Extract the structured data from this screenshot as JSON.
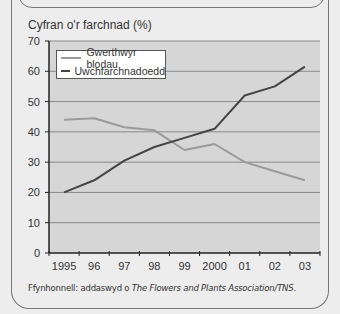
{
  "chart_data": {
    "type": "line",
    "title": "",
    "ylabel": "Cyfran o'r farchnad (%)",
    "xlabel": "",
    "categories": [
      "1995",
      "96",
      "97",
      "98",
      "99",
      "2000",
      "01",
      "02",
      "03"
    ],
    "ylim": [
      0,
      70
    ],
    "yticks": [
      0,
      10,
      20,
      30,
      40,
      50,
      60,
      70
    ],
    "grid": true,
    "legend_position": "top-left",
    "series": [
      {
        "name": "Gwerthwyr blodau",
        "color": "#9a9a9a",
        "values": [
          44,
          44.5,
          41.5,
          40.5,
          34,
          36,
          30,
          27,
          24
        ]
      },
      {
        "name": "Uwchfarchnadoedd",
        "color": "#444444",
        "values": [
          20,
          24,
          30.5,
          35,
          38,
          41,
          52,
          55,
          61.5
        ]
      }
    ]
  },
  "source": {
    "prefix": "Ffynhonnell: addaswyd o ",
    "italic": "The Flowers and Plants Association/TNS",
    "suffix": "."
  }
}
